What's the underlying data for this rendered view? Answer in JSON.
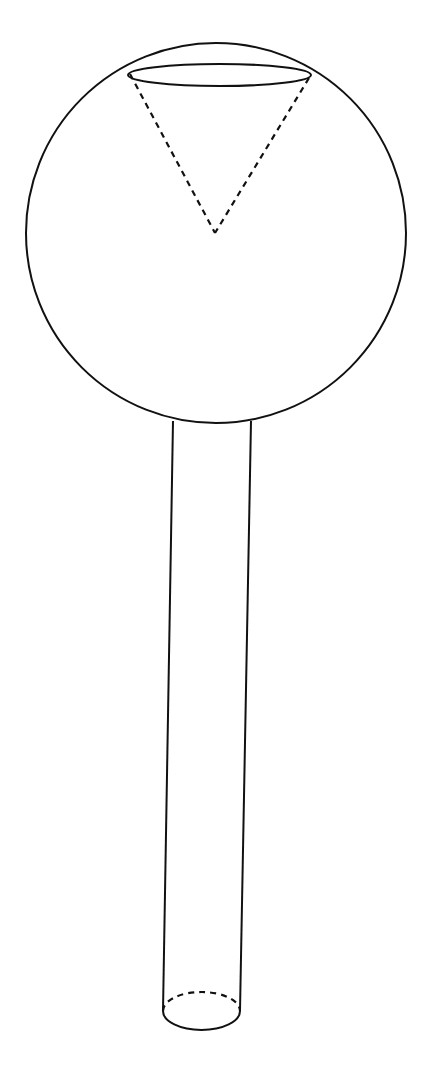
{
  "diagram": {
    "stroke_color": "#111111",
    "background": "#ffffff",
    "sphere": {
      "cx": 216,
      "cy": 233,
      "r": 190
    },
    "cap_ellipse": {
      "cx": 219.5,
      "cy": 74,
      "rx": 91.5,
      "ry": 11
    },
    "cone": {
      "left": [
        128,
        71
      ],
      "right": [
        311,
        71
      ],
      "apex": [
        215,
        233
      ]
    },
    "cylinder": {
      "top_left": [
        173,
        421
      ],
      "top_right": [
        251,
        421
      ],
      "bottom_left": [
        163,
        1011
      ],
      "bottom_right": [
        240,
        1011
      ]
    },
    "base_ellipse": {
      "cx": 201.5,
      "cy": 1011,
      "rx": 38.5,
      "ry": 19
    }
  }
}
